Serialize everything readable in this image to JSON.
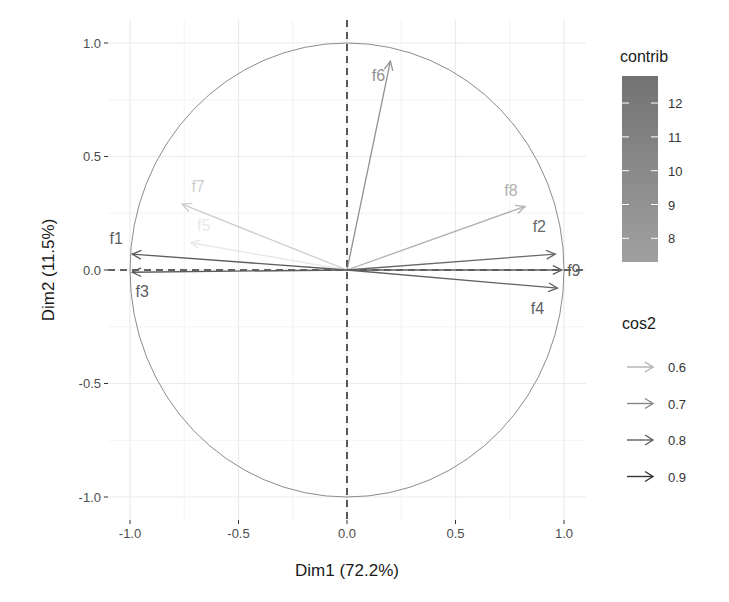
{
  "chart_data": {
    "type": "scatter",
    "subtype": "pca-variable-correlation-circle",
    "title": "",
    "xlabel": "Dim1 (72.2%)",
    "ylabel": "Dim2 (11.5%)",
    "xlim": [
      -1.0,
      1.0
    ],
    "ylim": [
      -1.0,
      1.0
    ],
    "x_ticks": [
      "-1.0",
      "-0.5",
      "0.0",
      "0.5",
      "1.0"
    ],
    "y_ticks": [
      "1.0",
      "0.5",
      "0.0",
      "-0.5",
      "-1.0"
    ],
    "grid": true,
    "unit_circle": true,
    "reference_lines": {
      "x": 0,
      "y": 0,
      "style": "dashed"
    },
    "variables": [
      {
        "name": "f1",
        "x": -0.99,
        "y": 0.07,
        "cos2": 0.98,
        "contrib": 12.5
      },
      {
        "name": "f2",
        "x": 0.96,
        "y": 0.07,
        "cos2": 0.93,
        "contrib": 11.9
      },
      {
        "name": "f3",
        "x": -0.99,
        "y": -0.01,
        "cos2": 0.98,
        "contrib": 12.5
      },
      {
        "name": "f4",
        "x": 0.97,
        "y": -0.08,
        "cos2": 0.95,
        "contrib": 12.1
      },
      {
        "name": "f5",
        "x": -0.72,
        "y": 0.12,
        "cos2": 0.53,
        "contrib": 7.3
      },
      {
        "name": "f6",
        "x": 0.2,
        "y": 0.92,
        "cos2": 0.89,
        "contrib": 8.5
      },
      {
        "name": "f7",
        "x": -0.76,
        "y": 0.29,
        "cos2": 0.66,
        "contrib": 8.0
      },
      {
        "name": "f8",
        "x": 0.82,
        "y": 0.28,
        "cos2": 0.75,
        "contrib": 9.3
      },
      {
        "name": "f9",
        "x": 0.99,
        "y": 0.0,
        "cos2": 0.98,
        "contrib": 12.6
      }
    ],
    "legends": [
      {
        "title": "contrib",
        "type": "colorbar",
        "ticks": [
          "12",
          "11",
          "10",
          "9",
          "8"
        ],
        "range": [
          7.3,
          12.8
        ]
      },
      {
        "title": "cos2",
        "type": "alpha",
        "entries": [
          "0.6",
          "0.7",
          "0.8",
          "0.9"
        ]
      }
    ],
    "legend_position": "right"
  },
  "legend_contrib": {
    "title": "contrib",
    "ticks": [
      "12",
      "11",
      "10",
      "9",
      "8"
    ]
  },
  "legend_cos2": {
    "title": "cos2",
    "entries": [
      "0.6",
      "0.7",
      "0.8",
      "0.9"
    ]
  },
  "colors": {
    "grid": "#ebebeb",
    "circle": "#8c8c8c",
    "dashed": "#333333",
    "colorbar_top": "#5a5a5a",
    "colorbar_bottom": "#8a8a8a"
  }
}
